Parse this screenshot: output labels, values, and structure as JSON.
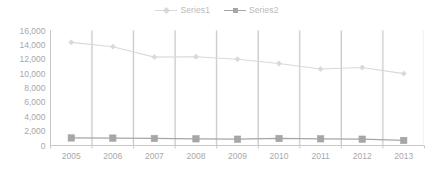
{
  "chart_data": {
    "type": "line",
    "title": "",
    "subtitle": "",
    "xlabel": "",
    "ylabel": "",
    "categories": [
      "2005",
      "2006",
      "2007",
      "2008",
      "2009",
      "2010",
      "2011",
      "2012",
      "2013"
    ],
    "ylim": [
      0,
      16000
    ],
    "ytick_values": [
      0,
      2000,
      4000,
      6000,
      8000,
      10000,
      12000,
      14000,
      16000
    ],
    "ytick_labels": [
      "0",
      "2,000",
      "4,000",
      "6,000",
      "8,000",
      "10,000",
      "12,000",
      "14,000",
      "16,000"
    ],
    "grid": "vertical-category-lines",
    "legend_position": "top-center",
    "series": [
      {
        "name": "Series1",
        "color": "#d9d9d9",
        "marker": "diamond",
        "values": [
          14350,
          13750,
          12300,
          12350,
          12000,
          11400,
          10650,
          10850,
          10000
        ]
      },
      {
        "name": "Series2",
        "color": "#a6a6a6",
        "marker": "square",
        "values": [
          1050,
          1030,
          980,
          930,
          880,
          980,
          930,
          880,
          700
        ]
      }
    ]
  },
  "legend": {
    "entries": [
      {
        "label": "Series1"
      },
      {
        "label": "Series2"
      }
    ]
  },
  "colors": {
    "series1": "#d9d9d9",
    "series2": "#a6a6a6",
    "axis": "#c8c8c8",
    "gridline_major": "#bdbdbd",
    "gridline_minor": "#e2e2e2",
    "tick_text": "#a8a8a8",
    "legend_text": "#b9b9b9",
    "background": "#ffffff"
  }
}
